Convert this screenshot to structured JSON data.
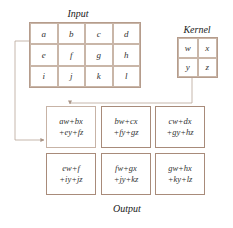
{
  "input": {
    "label": "Input",
    "cells": [
      [
        "a",
        "b",
        "c",
        "d"
      ],
      [
        "e",
        "f",
        "g",
        "h"
      ],
      [
        "i",
        "j",
        "k",
        "l"
      ]
    ]
  },
  "kernel": {
    "label": "Kernel",
    "cells": [
      [
        "w",
        "x"
      ],
      [
        "y",
        "z"
      ]
    ]
  },
  "output": {
    "label": "Output",
    "cells": [
      [
        {
          "l1": "aw+bx",
          "l2": "+ey+fz"
        },
        {
          "l1": "bw+cx",
          "l2": "+fy+gz"
        },
        {
          "l1": "cw+dx",
          "l2": "+gy+hz"
        }
      ],
      [
        {
          "l1": "ew+f",
          "l2": "+iy+jz"
        },
        {
          "l1": "fw+gx",
          "l2": "+jy+kz"
        },
        {
          "l1": "gw+hx",
          "l2": "+ky+lz"
        }
      ]
    ]
  },
  "colors": {
    "border": "#b59c8c",
    "line": "#b8a497"
  }
}
